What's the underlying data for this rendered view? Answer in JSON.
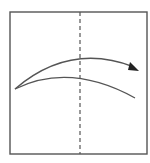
{
  "diagram": {
    "type": "origami-fold-step",
    "colors": {
      "stroke": "#555555",
      "background": "#ffffff"
    },
    "paper": {
      "x": 10,
      "y": 12,
      "width": 137,
      "height": 142
    },
    "fold_line": {
      "style": "dashed",
      "orientation": "vertical",
      "x": 80
    },
    "arrow": {
      "direction": "right",
      "meaning": "fold left half over to right"
    }
  }
}
